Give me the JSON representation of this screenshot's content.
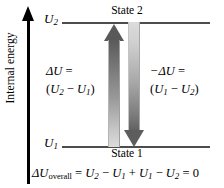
{
  "figure": {
    "background_color": "#ffffff",
    "line_color": "#4d4d4d",
    "arrow_color": "#5d5d5d"
  },
  "axis": {
    "label": "Internal energy",
    "direction": "up",
    "color": "#000000"
  },
  "levels": [
    {
      "id": "u2",
      "tick_label_symbol": "U",
      "tick_label_subscript": "2",
      "state_name": "State 2",
      "position": "top"
    },
    {
      "id": "u1",
      "tick_label_symbol": "U",
      "tick_label_subscript": "1",
      "state_name": "State 1",
      "position": "bottom"
    }
  ],
  "arrows": [
    {
      "id": "arrow-up",
      "direction": "up",
      "from": "State 1",
      "to": "State 2",
      "gradient": "dark-top-to-light-bottom"
    },
    {
      "id": "arrow-down",
      "direction": "down",
      "from": "State 2",
      "to": "State 1",
      "gradient": "light-top-to-dark-bottom"
    }
  ],
  "annotations": {
    "left": {
      "line1_symbol": "ΔU",
      "line1_equals": " =",
      "line2_open": "(",
      "line2_first": "U",
      "line2_first_sub": "2",
      "line2_operator": " − ",
      "line2_second": "U",
      "line2_second_sub": "1",
      "line2_close": ")"
    },
    "right": {
      "line1_symbol": "−ΔU",
      "line1_equals": " =",
      "line2_open": "(",
      "line2_first": "U",
      "line2_first_sub": "1",
      "line2_operator": " − ",
      "line2_second": "U",
      "line2_second_sub": "2",
      "line2_close": ")"
    }
  },
  "overall_equation": {
    "lhs_symbol": "ΔU",
    "lhs_subscript": "overall",
    "equals_1": " = ",
    "t1": "U",
    "t1_sub": "2",
    "op1": " − ",
    "t2": "U",
    "t2_sub": "1",
    "op2": " + ",
    "t3": "U",
    "t3_sub": "1",
    "op3": " − ",
    "t4": "U",
    "t4_sub": "2",
    "equals_2": " = ",
    "result": "0"
  }
}
